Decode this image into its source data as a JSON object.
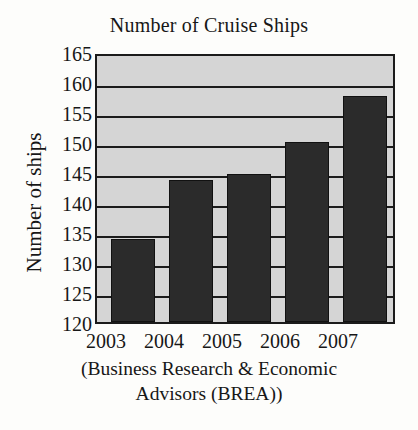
{
  "chart_data": {
    "type": "bar",
    "title": "Number of Cruise Ships",
    "xlabel": "",
    "ylabel": "Number of ships",
    "categories": [
      "2003",
      "2004",
      "2005",
      "2006",
      "2007"
    ],
    "values": [
      134,
      144,
      145,
      150.5,
      158.2
    ],
    "ylim": [
      120,
      165
    ],
    "ytick_step": 5,
    "yticks": [
      "165",
      "160",
      "155",
      "150",
      "145",
      "140",
      "135",
      "130",
      "125",
      "120"
    ],
    "grid": "horizontal",
    "legend": "none",
    "series": [
      {
        "name": "Number of ships",
        "values": [
          134,
          144,
          145,
          150.5,
          158.2
        ]
      }
    ],
    "caption_lines": [
      "(Business Research & Economic Advisors",
      "Advisors (BREA))"
    ]
  },
  "caption": {
    "line1": "(Business Research & Economic",
    "line2": "Advisors (BREA))"
  },
  "colors": {
    "bar": "#2b2b2b",
    "plot_background": "#d5d5d5",
    "axis": "#1b1b1b",
    "page_background": "#fdfdfb",
    "text": "#171717"
  }
}
